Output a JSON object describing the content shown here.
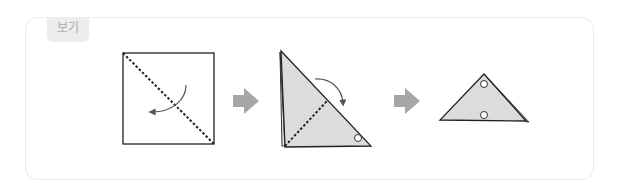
{
  "example_box": {
    "label": "보기",
    "steps": [
      {
        "name": "square-paper",
        "description": "Square paper with diagonal dotted fold line and curved arrow"
      },
      {
        "name": "triangle-fold",
        "description": "Folded triangle with dotted line and curved arrow, circle marker"
      },
      {
        "name": "final-triangle",
        "description": "Resulting triangle with two circle markers"
      }
    ],
    "arrows": [
      "step-arrow",
      "step-arrow"
    ],
    "colors": {
      "paper_fill": "#dcdcdc",
      "line": "#222222",
      "arrow": "#a6a6a6",
      "tag_bg": "#ececec",
      "tag_text": "#aaaaaa",
      "border": "#ebebeb"
    }
  }
}
